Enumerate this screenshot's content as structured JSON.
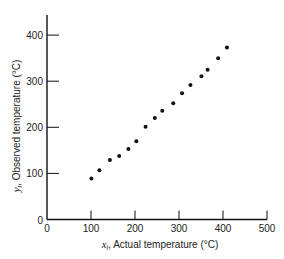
{
  "chart_data": {
    "type": "scatter",
    "title": "",
    "xlabel": "x_i, Actual temperature (°C)",
    "ylabel": "y_i, Observed temperature (°C)",
    "xlabel_var": "x",
    "xlabel_sub": "i",
    "xlabel_text": ", Actual temperature (°C)",
    "ylabel_var": "y",
    "ylabel_sub": "i",
    "ylabel_text": ", Observed temperature (°C)",
    "xlim": [
      0,
      500
    ],
    "ylim": [
      0,
      440
    ],
    "xticks": [
      0,
      100,
      200,
      300,
      400,
      500
    ],
    "yticks": [
      0,
      100,
      200,
      300,
      400
    ],
    "grid": false,
    "legend": null,
    "marker_color": "#111111",
    "series": [
      {
        "name": "Observations",
        "x": [
          101,
          119,
          143,
          164,
          185,
          203,
          224,
          245,
          262,
          287,
          307,
          326,
          351,
          365,
          389,
          409
        ],
        "y": [
          89,
          107,
          129,
          138,
          153,
          170,
          201,
          220,
          236,
          252,
          274,
          292,
          311,
          325,
          350,
          373
        ]
      }
    ]
  }
}
